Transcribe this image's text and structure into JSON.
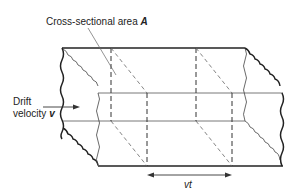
{
  "diagram": {
    "title_label": "Cross-sectional area",
    "title_symbol": "A",
    "drift_label_line1": "Drift",
    "drift_label_line2": "velocity",
    "drift_symbol": "v",
    "length_label": "vt"
  },
  "colors": {
    "background": "#ffffff",
    "line": "#222222",
    "thin_line": "#555555"
  }
}
